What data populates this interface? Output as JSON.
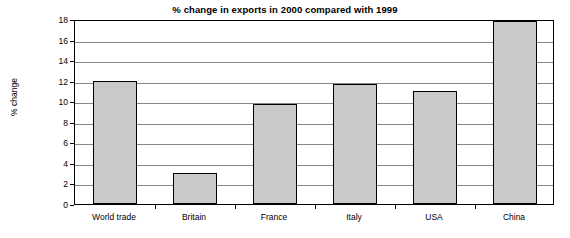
{
  "chart_data": {
    "type": "bar",
    "title": "% change in exports in 2000 compared with 1999",
    "xlabel": "",
    "ylabel": "% change",
    "categories": [
      "World trade",
      "Britain",
      "France",
      "Italy",
      "USA",
      "China"
    ],
    "values": [
      12.0,
      3.0,
      9.7,
      11.7,
      11.0,
      17.8
    ],
    "ylim": [
      0,
      18
    ],
    "yticks": [
      "0",
      "2",
      "4",
      "6",
      "8",
      "10",
      "12",
      "14",
      "16",
      "18"
    ],
    "ytick_values": [
      0,
      2,
      4,
      6,
      8,
      10,
      12,
      14,
      16,
      18
    ],
    "grid": true,
    "legend": "none",
    "bar_color": "#c9c9c9",
    "bar_border_color": "#000000",
    "axis_color": "#000000",
    "grid_color": "#8a8a8a"
  }
}
